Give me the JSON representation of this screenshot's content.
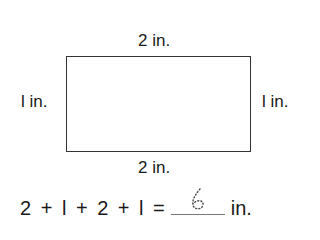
{
  "figure": {
    "shape": "rectangle",
    "top_label": "2 in.",
    "bottom_label": "2 in.",
    "left_label": "l in.",
    "right_label": "l in."
  },
  "equation": {
    "terms": [
      "2",
      "+",
      "l",
      "+",
      "2",
      "+",
      "l",
      "="
    ],
    "text": "2 + l + 2 + l =",
    "answer": "6",
    "answer_style": "dotted trace",
    "unit": "in."
  }
}
